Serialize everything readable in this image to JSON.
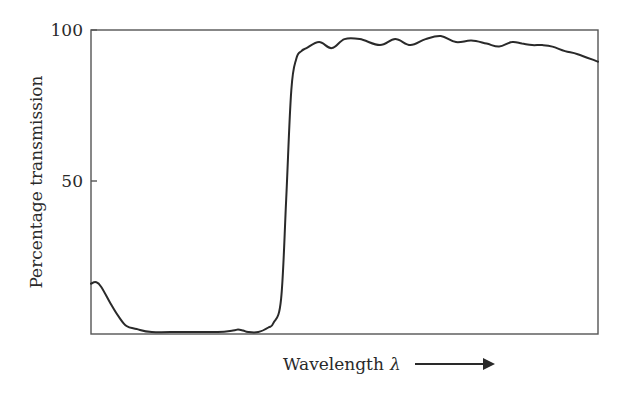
{
  "chart": {
    "title": "",
    "ylabel": "Percentage transmission",
    "xlabel_text": "Wavelength",
    "xlabel_symbol": "λ",
    "y_ticks": [
      {
        "value": 100,
        "label": "100"
      },
      {
        "value": 50,
        "label": "50"
      }
    ],
    "colors": {
      "line": "#2a2a2a",
      "axes": "#555555",
      "background": "#ffffff"
    }
  },
  "chart_data": {
    "type": "line",
    "title": "",
    "xlabel": "Wavelength λ →",
    "ylabel": "Percentage transmission",
    "ylim": [
      0,
      100
    ],
    "xlim": [
      0,
      100
    ],
    "x_ticks": [],
    "y_ticks": [
      50,
      100
    ],
    "grid": false,
    "legend": null,
    "x_units": "relative (no tick labels; arrow indicates increasing wavelength)",
    "series": [
      {
        "name": "Transmission",
        "x": [
          0,
          1,
          2,
          4,
          5.5,
          7,
          9,
          12,
          18,
          25,
          28,
          29,
          30,
          31,
          33,
          35,
          36,
          37.5,
          38.5,
          39.5,
          40.5,
          41.5,
          42.5,
          45,
          47.5,
          50,
          53,
          57,
          60,
          63,
          66,
          69,
          72,
          75,
          78,
          80.5,
          83,
          85,
          87,
          89,
          91,
          93.5,
          96,
          100
        ],
        "y": [
          16,
          16.5,
          15,
          9,
          5,
          2,
          1,
          0,
          0,
          0,
          0.5,
          0.8,
          0.5,
          0,
          0,
          1.5,
          3,
          11,
          44,
          80,
          90.5,
          93,
          94,
          96,
          94,
          97,
          97,
          95,
          97,
          95,
          97,
          98,
          96,
          96.5,
          95.5,
          94.5,
          96,
          95.5,
          95,
          95,
          94.5,
          93,
          92,
          89.5
        ]
      }
    ]
  }
}
